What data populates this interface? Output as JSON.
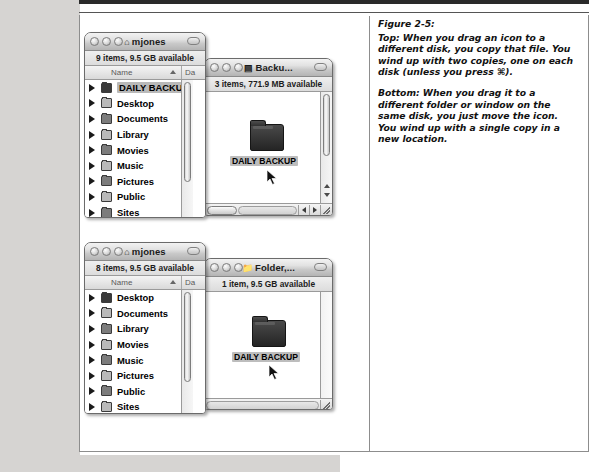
{
  "figure": {
    "label": "Figure 2-5:",
    "paragraphs": [
      "Top: When you drag an icon to a different disk, you copy that file. You wind up with two copies, one on each disk (unless you press ⌘).",
      "Bottom: When you drag it to a different folder or window on the same disk, you just move the icon. You wind up with a single copy in a new location."
    ]
  },
  "windows": {
    "top_left": {
      "title": "mjones",
      "title_icon": "home-icon",
      "status": "9 items, 9.5 GB available",
      "columns": [
        "Name",
        "Da"
      ],
      "sort_column": "Name",
      "items": [
        {
          "name": "DAILY BACKUP",
          "icon": "folder-icon",
          "selected": true
        },
        {
          "name": "Desktop",
          "icon": "desktop-folder-icon",
          "selected": false
        },
        {
          "name": "Documents",
          "icon": "documents-folder-icon",
          "selected": false
        },
        {
          "name": "Library",
          "icon": "library-folder-icon",
          "selected": false
        },
        {
          "name": "Movies",
          "icon": "movies-folder-icon",
          "selected": false
        },
        {
          "name": "Music",
          "icon": "music-folder-icon",
          "selected": false
        },
        {
          "name": "Pictures",
          "icon": "pictures-folder-icon",
          "selected": false
        },
        {
          "name": "Public",
          "icon": "public-folder-icon",
          "selected": false
        },
        {
          "name": "Sites",
          "icon": "sites-folder-icon",
          "selected": false
        }
      ]
    },
    "top_right": {
      "title": "Backu...",
      "title_icon": "disk-icon",
      "status": "3 items, 771.9 MB available",
      "icon_item": {
        "name": "DAILY BACKUP",
        "icon": "folder-icon",
        "selected": true
      }
    },
    "bottom_left": {
      "title": "mjones",
      "title_icon": "home-icon",
      "status": "8 items, 9.5 GB available",
      "columns": [
        "Name",
        "Da"
      ],
      "sort_column": "Name",
      "items": [
        {
          "name": "Desktop",
          "icon": "desktop-folder-icon",
          "selected": false
        },
        {
          "name": "Documents",
          "icon": "documents-folder-icon",
          "selected": false
        },
        {
          "name": "Library",
          "icon": "library-folder-icon",
          "selected": false
        },
        {
          "name": "Movies",
          "icon": "movies-folder-icon",
          "selected": false
        },
        {
          "name": "Music",
          "icon": "music-folder-icon",
          "selected": false
        },
        {
          "name": "Pictures",
          "icon": "pictures-folder-icon",
          "selected": false
        },
        {
          "name": "Public",
          "icon": "public-folder-icon",
          "selected": false
        },
        {
          "name": "Sites",
          "icon": "sites-folder-icon",
          "selected": false
        }
      ]
    },
    "bottom_right": {
      "title": "Folder,...",
      "title_icon": "folder-icon",
      "status": "1 item, 9.5 GB available",
      "icon_item": {
        "name": "DAILY BACKUP",
        "icon": "folder-icon",
        "selected": true
      }
    }
  },
  "controls": {
    "close_label": "",
    "minimize_label": "",
    "zoom_label": "",
    "toolbar_toggle_label": ""
  }
}
